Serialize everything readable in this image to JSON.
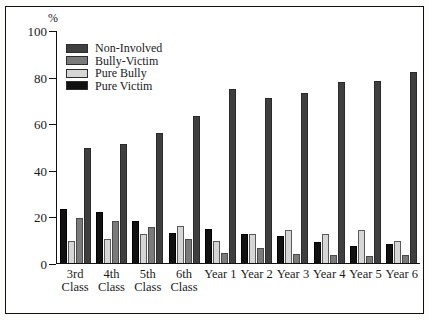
{
  "chart_data": {
    "type": "bar",
    "title": "",
    "subtitle": "",
    "xlabel": "",
    "ylabel": "%",
    "ylim": [
      0,
      100
    ],
    "yticks": [
      0,
      20,
      40,
      60,
      80,
      100
    ],
    "grid": false,
    "legend_position": "top-left",
    "categories": [
      "3rd Class",
      "4th Class",
      "5th Class",
      "6th Class",
      "Year 1",
      "Year 2",
      "Year 3",
      "Year 4",
      "Year 5",
      "Year 6"
    ],
    "category_lines": [
      [
        "3rd",
        "Class"
      ],
      [
        "4th",
        "Class"
      ],
      [
        "5th",
        "Class"
      ],
      [
        "6th",
        "Class"
      ],
      [
        "Year 1",
        ""
      ],
      [
        "Year 2",
        ""
      ],
      [
        "Year 3",
        ""
      ],
      [
        "Year 4",
        ""
      ],
      [
        "Year 5",
        ""
      ],
      [
        "Year 6",
        ""
      ]
    ],
    "series": [
      {
        "name": "Non-Involved",
        "color": "#3f3f3f",
        "values": [
          49.5,
          51.0,
          56.0,
          63.0,
          74.5,
          71.0,
          73.0,
          77.5,
          78.0,
          82.0
        ]
      },
      {
        "name": "Bully-Victim",
        "color": "#7b7b7b",
        "values": [
          19.5,
          18.0,
          15.5,
          10.5,
          4.5,
          6.5,
          4.0,
          3.5,
          3.0,
          3.5
        ]
      },
      {
        "name": "Pure Bully",
        "color": "#d6d6d6",
        "values": [
          9.5,
          10.5,
          12.5,
          16.0,
          9.5,
          12.5,
          14.0,
          12.5,
          14.0,
          9.5
        ]
      },
      {
        "name": "Pure Victim",
        "color": "#111111",
        "values": [
          23.0,
          22.0,
          18.0,
          13.0,
          14.5,
          12.5,
          11.5,
          9.0,
          7.5,
          8.0
        ]
      }
    ],
    "bar_order_in_group": [
      "Pure Victim",
      "Pure Bully",
      "Bully-Victim",
      "Non-Involved"
    ]
  },
  "legend": {
    "items": [
      {
        "label": "Non-Involved",
        "swatch": "dark-gray-swatch"
      },
      {
        "label": "Bully-Victim",
        "swatch": "medium-gray-swatch"
      },
      {
        "label": "Pure Bully",
        "swatch": "light-gray-swatch"
      },
      {
        "label": "Pure Victim",
        "swatch": "black-swatch"
      }
    ]
  }
}
